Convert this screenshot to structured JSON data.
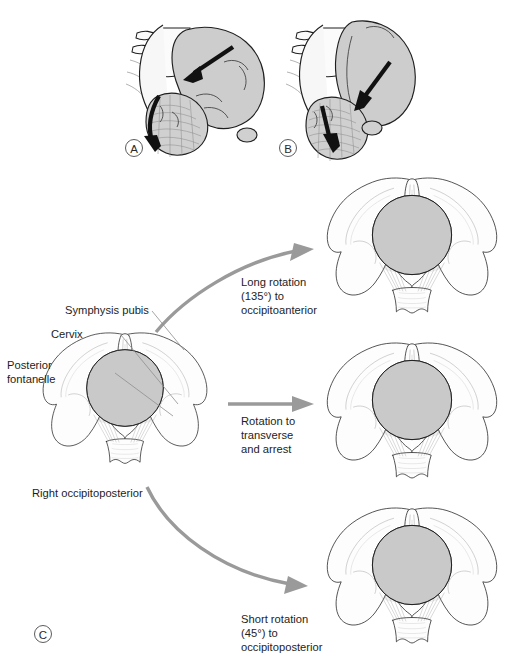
{
  "figure": {
    "panels": [
      {
        "id": "A",
        "letter": "A"
      },
      {
        "id": "B",
        "letter": "B"
      },
      {
        "id": "C",
        "letter": "C"
      }
    ]
  },
  "labels": {
    "symphysis_pubis": "Symphysis pubis",
    "cervix": "Cervix",
    "posterior_fontanelle_line1": "Posterior",
    "posterior_fontanelle_line2": "fontanelle",
    "right_occipitoposterior": "Right occipitoposterior"
  },
  "annotations": {
    "long_rotation": {
      "line1": "Long rotation",
      "line2": "(135°) to",
      "line3": "occipitoanterior"
    },
    "transverse_arrest": {
      "line1": "Rotation to",
      "line2": "transverse",
      "line3": "and arrest"
    },
    "short_rotation": {
      "line1": "Short rotation",
      "line2": "(45°) to",
      "line3": "occipitoposterior"
    }
  },
  "caption": {
    "text": ""
  },
  "colors": {
    "ink": "#1d1d1d",
    "gray_arrow": "#9a9a9a",
    "black_arrow": "#111111",
    "head_fill": "#d3d3d3",
    "fontanelle": "#6d6d6d",
    "bone_fill": "#fdfdfd",
    "soft_shade": "#dcdcdc",
    "page_background": "#ffffff"
  },
  "pelvis_views": [
    {
      "id": "origin",
      "position_name": "Right occipitoposterior",
      "suture_orientation": "oblique-right-posterior"
    },
    {
      "id": "occipitoanterior",
      "position_name": "Occipitoanterior",
      "suture_orientation": "vertical"
    },
    {
      "id": "transverse",
      "position_name": "Transverse arrest",
      "suture_orientation": "horizontal"
    },
    {
      "id": "occipitoposterior",
      "position_name": "Occipitoposterior",
      "suture_orientation": "vertical"
    }
  ]
}
